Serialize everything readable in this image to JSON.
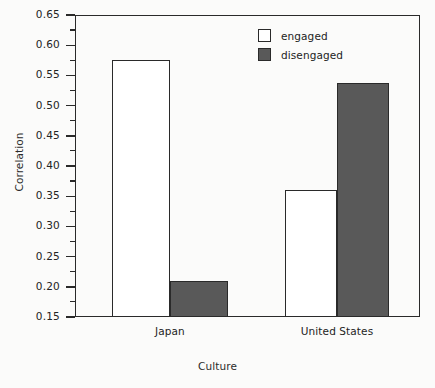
{
  "chart_data": {
    "type": "bar",
    "title": "",
    "xlabel": "Culture",
    "ylabel": "Correlation",
    "categories": [
      "Japan",
      "United States"
    ],
    "series": [
      {
        "name": "engaged",
        "values": [
          0.575,
          0.36
        ]
      },
      {
        "name": "disengaged",
        "values": [
          0.21,
          0.537
        ]
      }
    ],
    "ylim": [
      0.15,
      0.65
    ],
    "ytick_step": 0.05,
    "yticks": [
      "0.65",
      "0.60",
      "0.55",
      "0.50",
      "0.45",
      "0.40",
      "0.35",
      "0.30",
      "0.25",
      "0.20",
      "0.15"
    ],
    "minor_ticks": true,
    "minor_tick_step": 0.025,
    "grid": false,
    "legend_position": "top-center",
    "colors": {
      "engaged": "#ffffff",
      "disengaged": "#595959",
      "axis": "#2a2a2a",
      "text": "#232323",
      "background": "#fbfbfa"
    }
  },
  "legend": {
    "entries": [
      {
        "label": "engaged"
      },
      {
        "label": "disengaged"
      }
    ]
  }
}
